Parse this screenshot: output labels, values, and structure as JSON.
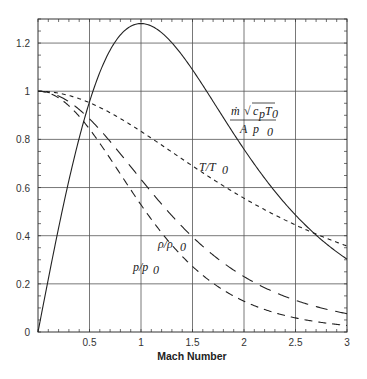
{
  "chart_data": {
    "type": "line",
    "title": "",
    "xlabel": "Mach Number",
    "ylabel": "",
    "xlim": [
      0,
      3
    ],
    "ylim": [
      0,
      1.3
    ],
    "grid": true,
    "x_ticks": [
      "0.5",
      "1",
      "1.5",
      "2",
      "2.5",
      "3"
    ],
    "y_ticks": [
      "0",
      "0.2",
      "0.4",
      "0.6",
      "0.8",
      "1",
      "1.2"
    ],
    "x": [
      0,
      0.25,
      0.5,
      0.75,
      1.0,
      1.25,
      1.5,
      1.75,
      2.0,
      2.25,
      2.5,
      2.75,
      3.0
    ],
    "series": [
      {
        "name": "mass flow parameter",
        "label": "ṁ √(cpT0) / (A p0)",
        "style": "solid",
        "values": [
          0,
          0.38,
          0.94,
          1.18,
          1.28,
          1.24,
          1.12,
          0.96,
          0.8,
          0.66,
          0.53,
          0.41,
          0.31
        ]
      },
      {
        "name": "T/T0",
        "label": "T/T0",
        "style": "short-dash",
        "values": [
          1.0,
          0.988,
          0.952,
          0.899,
          0.833,
          0.762,
          0.69,
          0.62,
          0.556,
          0.497,
          0.444,
          0.398,
          0.357
        ]
      },
      {
        "name": "rho/rho0",
        "label": "ρ/ρ0",
        "style": "long-dash",
        "values": [
          1.0,
          0.969,
          0.885,
          0.766,
          0.634,
          0.507,
          0.395,
          0.302,
          0.23,
          0.175,
          0.132,
          0.1,
          0.076
        ]
      },
      {
        "name": "p/p0",
        "label": "p/p0",
        "style": "medium-dash",
        "values": [
          1.0,
          0.957,
          0.843,
          0.689,
          0.528,
          0.386,
          0.272,
          0.187,
          0.128,
          0.087,
          0.059,
          0.04,
          0.027
        ]
      }
    ],
    "annotations": [
      {
        "text": "ṁ √(cpT0) / (A p0)",
        "x": 2.3,
        "y": 0.9
      },
      {
        "text": "T/T0",
        "x": 2.1,
        "y": 0.68
      },
      {
        "text": "ρ/ρ0",
        "x": 1.4,
        "y": 0.5
      },
      {
        "text": "p/p0",
        "x": 0.85,
        "y": 0.45
      }
    ]
  },
  "labels": {
    "xlabel": "Mach Number",
    "mdot_num": "ṁ",
    "sqrt_content": "c",
    "sqrt_sub_p": "p",
    "sqrt_T": "T",
    "sqrt_sub_0": "0",
    "mdot_den": "A  p",
    "den_sub": "0",
    "tt0_T": "T/T",
    "tt0_sub": "0",
    "rho": "ρ/ρ",
    "rho_sub": "0",
    "p": "p/p",
    "p_sub": "0"
  }
}
